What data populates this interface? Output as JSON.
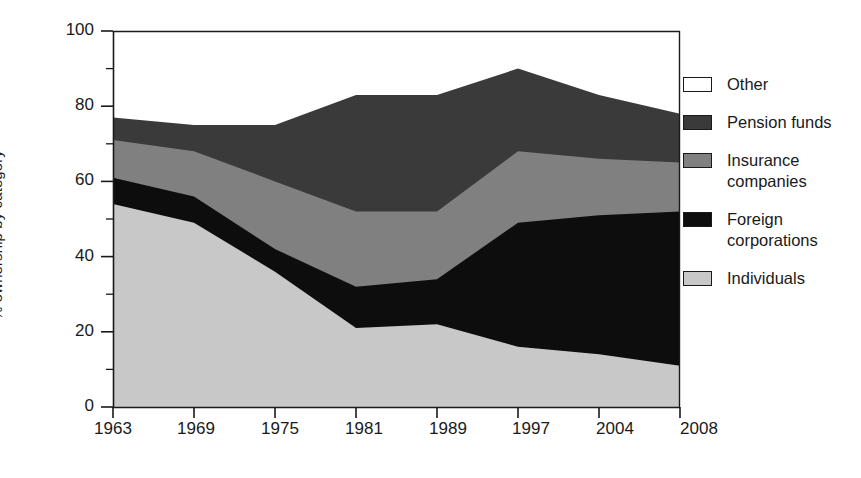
{
  "chart_data": {
    "type": "area",
    "stacked": true,
    "title": "",
    "xlabel": "",
    "ylabel": "% ownership by category",
    "categories": [
      "1963",
      "1969",
      "1975",
      "1981",
      "1989",
      "1997",
      "2004",
      "2008"
    ],
    "x": [
      1963,
      1969,
      1975,
      1981,
      1989,
      1997,
      2004,
      2008
    ],
    "ylim": [
      0,
      100
    ],
    "yticks": [
      0,
      20,
      40,
      60,
      80,
      100
    ],
    "yticklabels": [
      "0",
      "20",
      "40",
      "60",
      "80",
      "100"
    ],
    "yminorticks": [
      10,
      30,
      50,
      70,
      90
    ],
    "grid": false,
    "legend_position": "right",
    "series": [
      {
        "name": "Individuals",
        "color": "#c8c8c8",
        "values": [
          54,
          49,
          36,
          21,
          22,
          16,
          14,
          11
        ]
      },
      {
        "name": "Foreign corporations",
        "color": "#0d0d0d",
        "values": [
          7,
          7,
          6,
          11,
          12,
          33,
          37,
          41
        ]
      },
      {
        "name": "Insurance companies",
        "color": "#808080",
        "values": [
          10,
          12,
          18,
          20,
          18,
          19,
          15,
          13
        ]
      },
      {
        "name": "Pension funds",
        "color": "#3a3a3a",
        "values": [
          6,
          7,
          15,
          31,
          31,
          22,
          17,
          13
        ]
      },
      {
        "name": "Other",
        "color": "#ffffff",
        "values": [
          23,
          25,
          25,
          17,
          17,
          10,
          17,
          22
        ]
      }
    ],
    "cumulative_tops": {
      "Individuals": [
        54,
        49,
        36,
        21,
        22,
        16,
        14,
        11
      ],
      "Foreign corporations": [
        61,
        56,
        42,
        32,
        34,
        49,
        51,
        52
      ],
      "Insurance companies": [
        71,
        68,
        60,
        52,
        52,
        68,
        66,
        65
      ],
      "Pension funds": [
        77,
        75,
        75,
        83,
        83,
        90,
        83,
        78
      ],
      "Other": [
        100,
        100,
        100,
        100,
        100,
        100,
        100,
        100
      ]
    }
  },
  "legend": {
    "items": [
      {
        "label": "Other",
        "color": "#ffffff"
      },
      {
        "label": "Pension funds",
        "color": "#3a3a3a"
      },
      {
        "label": "Insurance companies",
        "color": "#808080"
      },
      {
        "label": "Foreign corporations",
        "color": "#0d0d0d"
      },
      {
        "label": "Individuals",
        "color": "#c8c8c8"
      }
    ]
  },
  "axes": {
    "y_axis_title": "% ownership by category",
    "y_tick_labels": [
      "100",
      "80",
      "60",
      "40",
      "20",
      "0"
    ],
    "x_tick_labels": [
      "1963",
      "1969",
      "1975",
      "1981",
      "1989",
      "1997",
      "2004",
      "2008"
    ]
  }
}
